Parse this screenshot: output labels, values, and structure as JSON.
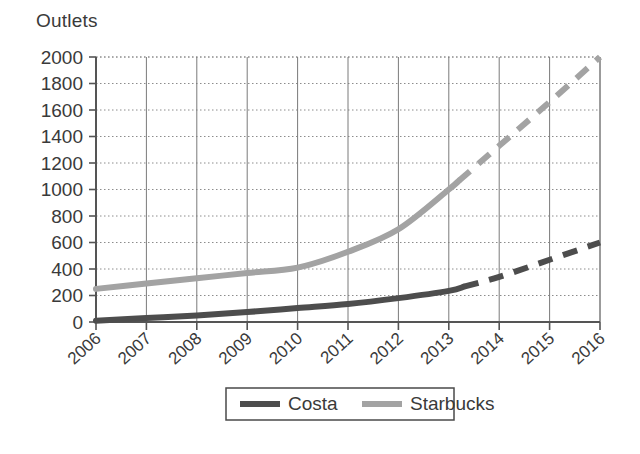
{
  "chart_data": {
    "type": "line",
    "title": "",
    "ylabel": "Outlets",
    "xlabel": "",
    "ylim": [
      0,
      2000
    ],
    "ytick_step": 200,
    "yticks": [
      0,
      200,
      400,
      600,
      800,
      1000,
      1200,
      1400,
      1600,
      1800,
      2000
    ],
    "ytick_labels": [
      "0",
      "200",
      "400",
      "600",
      "800",
      "1000",
      "1200",
      "1400",
      "1600",
      "1800",
      "2000"
    ],
    "categories": [
      2006,
      2007,
      2008,
      2009,
      2010,
      2011,
      2012,
      2013,
      2014,
      2015,
      2016
    ],
    "xtick_labels": [
      "2006",
      "2007",
      "2008",
      "2009",
      "2010",
      "2011",
      "2012",
      "2013",
      "2014",
      "2015",
      "2016"
    ],
    "xlim": [
      2006,
      2016
    ],
    "grid": true,
    "grid_style": "dotted-horizontal-solid-vertical",
    "legend_position": "bottom",
    "series": [
      {
        "name": "Costa",
        "color": "#4d4d4d",
        "x": [
          2006,
          2007,
          2008,
          2009,
          2010,
          2011,
          2012,
          2013,
          2014,
          2015,
          2016
        ],
        "values": [
          10,
          30,
          50,
          75,
          105,
          135,
          180,
          235,
          340,
          470,
          600
        ],
        "solid_until": 2013.3,
        "projection_note": "dashed from 2013.3 onward"
      },
      {
        "name": "Starbucks",
        "color": "#a3a3a3",
        "x": [
          2006,
          2007,
          2008,
          2009,
          2010,
          2011,
          2012,
          2013,
          2014,
          2015,
          2016
        ],
        "values": [
          250,
          290,
          330,
          370,
          410,
          530,
          700,
          1000,
          1330,
          1660,
          2000
        ],
        "solid_until": 2013.2,
        "projection_note": "dashed from 2013.2 onward"
      }
    ]
  },
  "legend": {
    "items": [
      {
        "label": "Costa",
        "color": "#4d4d4d"
      },
      {
        "label": "Starbucks",
        "color": "#a3a3a3"
      }
    ]
  },
  "colors": {
    "costa": "#4d4d4d",
    "starbucks": "#a3a3a3",
    "axis": "#555555",
    "grid_vertical": "#7a7a7a",
    "grid_horizontal": "#8c8c8c",
    "text": "#3a3a3a",
    "background": "#ffffff"
  }
}
